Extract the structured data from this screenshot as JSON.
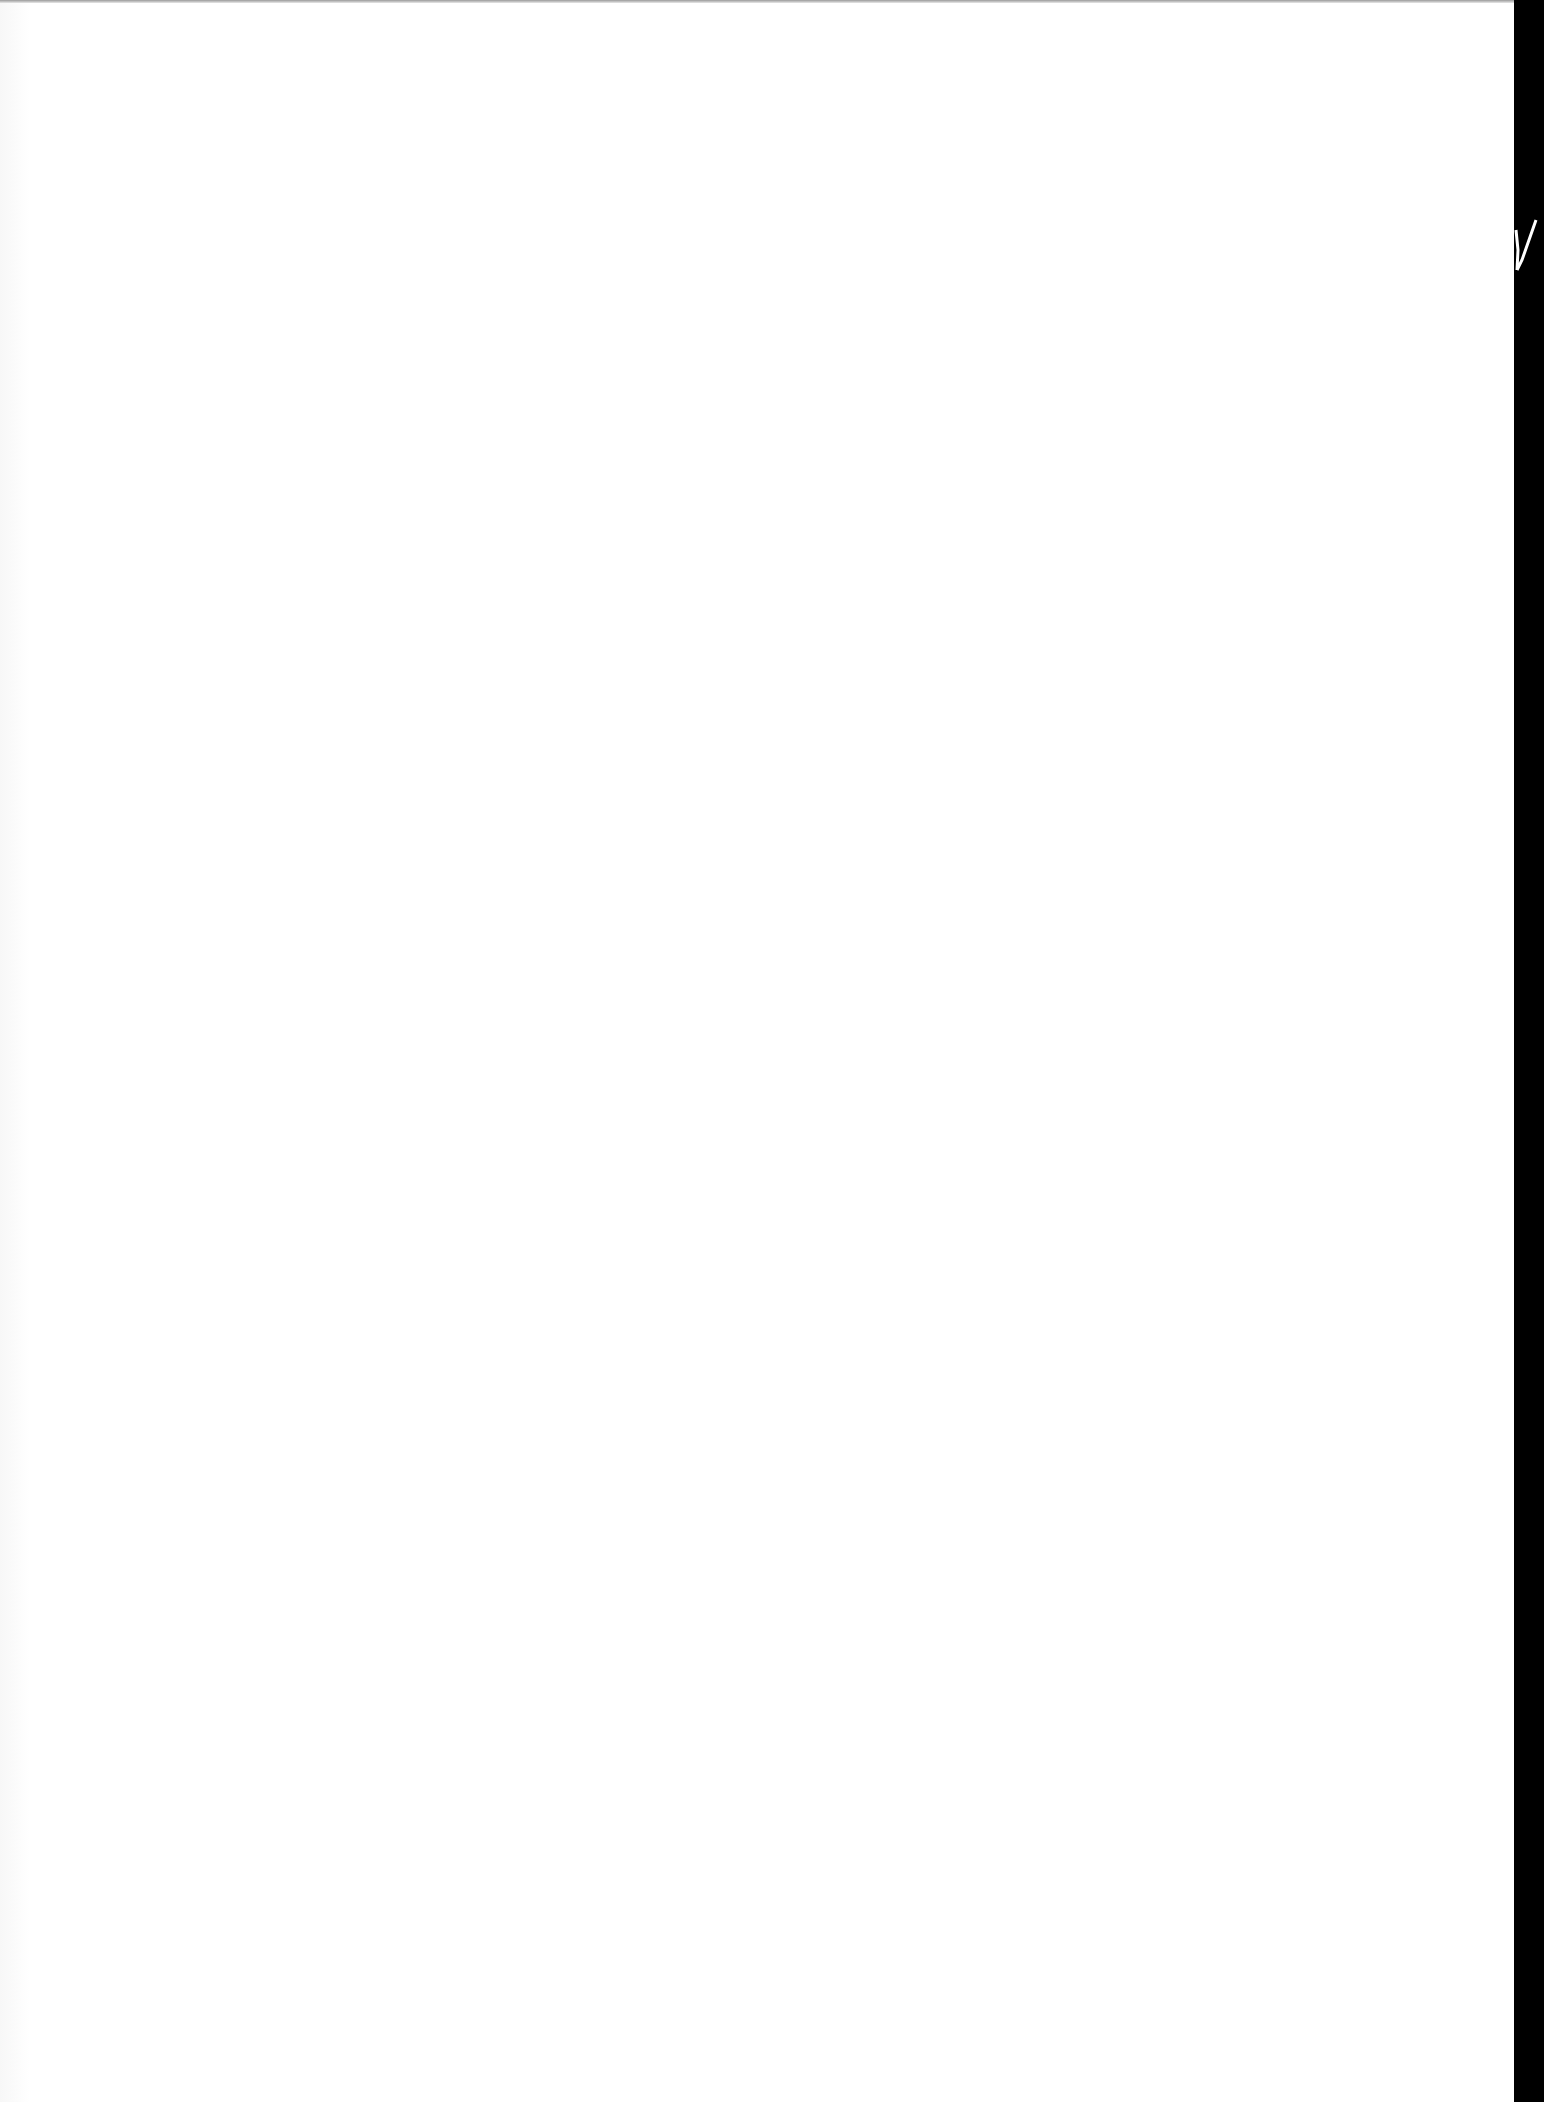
{
  "document": {
    "type": "blank scanned page",
    "text": "",
    "colors": {
      "page": "#ffffff",
      "scan_edge": "#000000"
    }
  }
}
